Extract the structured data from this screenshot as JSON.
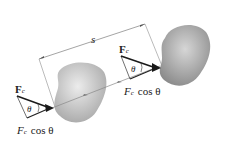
{
  "diagram": {
    "distance_label": "s",
    "left": {
      "force_label": "F",
      "force_subscript": "c",
      "angle_label": "θ",
      "component_label_F": "F",
      "component_label_sub": "c",
      "component_label_rest": "cos θ"
    },
    "right": {
      "force_label": "F",
      "force_subscript": "c",
      "angle_label": "θ",
      "component_label_F": "F",
      "component_label_sub": "c",
      "component_label_rest": "cos θ"
    },
    "colors": {
      "body_light": "#d8d8d8",
      "body_dark": "#8c8c8c",
      "arrow": "#1a1a1a",
      "dimension_line": "#555555"
    }
  }
}
